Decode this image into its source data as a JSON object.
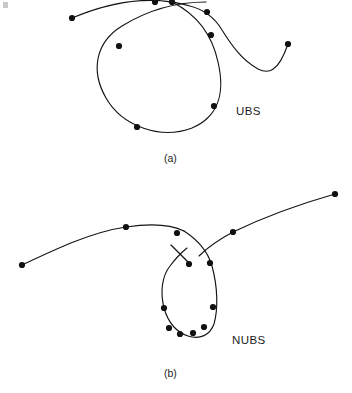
{
  "page": {
    "background_color": "#ffffff",
    "ink_color": "#141414",
    "width": 352,
    "height": 393
  },
  "figures": [
    {
      "id": "figure-a",
      "label": "UBS",
      "label_full": "Uniform B-Spline",
      "caption": "(a)",
      "description": "Uniform B-spline curve forming a broad teardrop loop with two open arms crossing near the top",
      "control_point_count": 9,
      "curve_color": "#141414",
      "dot_color": "#111111"
    },
    {
      "id": "figure-b",
      "label": "NUBS",
      "label_full": "Non-Uniform B-Spline",
      "caption": "(b)",
      "description": "Non-uniform B-spline curve forming a narrow vertical loop with two open arms crossing near the top",
      "control_point_count": 12,
      "curve_color": "#141414",
      "dot_color": "#111111"
    }
  ],
  "chart_data": {
    "type": "line",
    "title": "",
    "xlabel": "",
    "ylabel": "",
    "grid": false,
    "legend": "none",
    "axis_visible": false,
    "xlim": [
      0,
      352
    ],
    "ylim": [
      0,
      393
    ],
    "y_axis_inverted": true,
    "series": [
      {
        "name": "UBS curve",
        "figure": "figure-a",
        "style": "solid",
        "color": "#141414",
        "markers": "filled-circle",
        "path": "M 72 18 C 110 2 150 -6 190 6 C 205 10 215 18 222 30 C 232 46 242 60 258 69 C 268 74 278 73 288 44",
        "marker_points": [
          {
            "x": 72,
            "y": 18
          },
          {
            "x": 155,
            "y": 2
          },
          {
            "x": 207,
            "y": 12
          },
          {
            "x": 288,
            "y": 44
          }
        ]
      },
      {
        "name": "UBS loop",
        "figure": "figure-b",
        "style": "solid",
        "color": "#141414",
        "markers": "filled-circle",
        "path": "M 172 2 C 196 14 212 34 218 62 C 226 96 216 118 192 128 C 160 140 122 126 106 98 C 90 70 96 42 122 26 C 148 10 178 2 206 2",
        "marker_points": [
          {
            "x": 172,
            "y": 2
          },
          {
            "x": 211,
            "y": 35
          },
          {
            "x": 214,
            "y": 106
          },
          {
            "x": 137,
            "y": 127
          },
          {
            "x": 119,
            "y": 46
          }
        ]
      },
      {
        "name": "NUBS left arm",
        "figure": "figure-b",
        "style": "solid",
        "color": "#141414",
        "markers": "filled-circle",
        "path": "M 22 265 C 58 248 92 232 126 227 C 152 223 170 224 184 231",
        "marker_points": [
          {
            "x": 22,
            "y": 265
          },
          {
            "x": 126,
            "y": 227
          },
          {
            "x": 177,
            "y": 233
          }
        ]
      },
      {
        "name": "NUBS right arm",
        "figure": "figure-b",
        "style": "solid",
        "color": "#141414",
        "markers": "filled-circle",
        "path": "M 335 194 C 300 204 262 218 233 232 C 218 240 207 248 199 256",
        "marker_points": [
          {
            "x": 335,
            "y": 194
          },
          {
            "x": 233,
            "y": 232
          }
        ]
      },
      {
        "name": "NUBS loop",
        "figure": "figure-b",
        "style": "solid",
        "color": "#141414",
        "markers": "filled-circle",
        "path": "M 184 231 C 198 240 208 252 212 266 C 218 288 218 310 214 324 C 210 335 200 340 188 336 C 176 332 168 322 164 308 C 160 292 162 276 170 266 C 176 258 182 252 187 248",
        "marker_points": [
          {
            "x": 189,
            "y": 264
          },
          {
            "x": 210,
            "y": 263
          },
          {
            "x": 213,
            "y": 307
          },
          {
            "x": 204,
            "y": 327
          },
          {
            "x": 193,
            "y": 333
          },
          {
            "x": 180,
            "y": 334
          },
          {
            "x": 169,
            "y": 328
          },
          {
            "x": 164,
            "y": 308
          }
        ]
      },
      {
        "name": "NUBS tangent segment",
        "figure": "figure-b",
        "style": "solid",
        "color": "#141414",
        "markers": "none",
        "path": "M 171 245 L 190 264",
        "marker_points": []
      }
    ],
    "annotations": [
      {
        "text": "UBS",
        "x": 236,
        "y": 111
      },
      {
        "text": "NUBS",
        "x": 232,
        "y": 340
      },
      {
        "text": "(a)",
        "x": 164,
        "y": 160
      },
      {
        "text": "(b)",
        "x": 164,
        "y": 375
      }
    ]
  }
}
